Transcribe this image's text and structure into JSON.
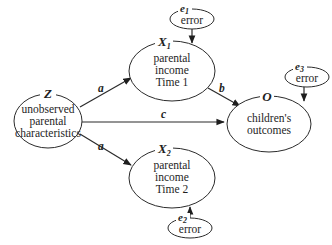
{
  "diagram": {
    "type": "path-diagram",
    "nodes": {
      "Z": {
        "symbol": "Z",
        "subscript": "",
        "lines": [
          "unobserved",
          "parental",
          "characteristics"
        ]
      },
      "X1": {
        "symbol": "X",
        "subscript": "1",
        "lines": [
          "parental",
          "income",
          "Time 1"
        ]
      },
      "X2": {
        "symbol": "X",
        "subscript": "2",
        "lines": [
          "parental",
          "income",
          "Time 2"
        ]
      },
      "O": {
        "symbol": "O",
        "subscript": "",
        "lines": [
          "children's",
          "outcomes"
        ]
      },
      "e1": {
        "symbol": "e",
        "subscript": "1",
        "lines": [
          "error"
        ]
      },
      "e2": {
        "symbol": "e",
        "subscript": "2",
        "lines": [
          "error"
        ]
      },
      "e3": {
        "symbol": "e",
        "subscript": "3",
        "lines": [
          "error"
        ]
      }
    },
    "edges": [
      {
        "from": "Z",
        "to": "X1",
        "label": "a"
      },
      {
        "from": "Z",
        "to": "X2",
        "label": "a"
      },
      {
        "from": "Z",
        "to": "O",
        "label": "c"
      },
      {
        "from": "X1",
        "to": "O",
        "label": "b"
      },
      {
        "from": "e1",
        "to": "X1",
        "label": ""
      },
      {
        "from": "e2",
        "to": "X2",
        "label": ""
      },
      {
        "from": "e3",
        "to": "O",
        "label": ""
      }
    ]
  }
}
